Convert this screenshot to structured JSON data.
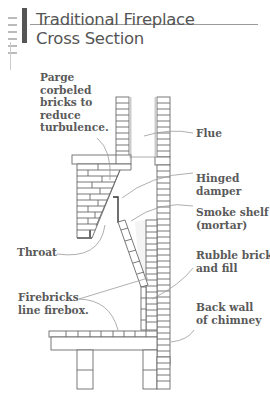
{
  "title": {
    "line1": "Traditional Fireplace",
    "line2": "Cross Section"
  },
  "labels": {
    "parge": "Parge\ncorbeled\nbricks to\nreduce\nturbulence.",
    "flue": "Flue",
    "hinged_damper": "Hinged\ndamper",
    "smoke_shelf": "Smoke shelf\n(mortar)",
    "throat": "Throat",
    "rubble": "Rubble brick\nand fill",
    "firebricks": "Firebricks\nline firebox.",
    "back_wall": "Back wall\nof chimney"
  },
  "colors": {
    "line": "#6a6a6a",
    "text": "#5a5a5a",
    "leader": "#9a9a9a",
    "title_bar": "#555555"
  }
}
